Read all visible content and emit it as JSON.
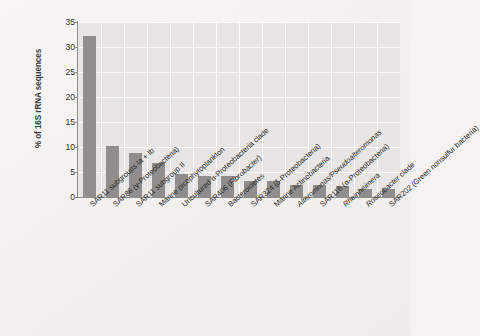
{
  "chart_data": {
    "type": "bar",
    "title": "",
    "xlabel": "",
    "ylabel": "% of 16S rRNA sequences",
    "ylim": [
      0,
      35
    ],
    "yticks": [
      0,
      5,
      10,
      15,
      20,
      25,
      30,
      35
    ],
    "grid": true,
    "legend": "none",
    "bar_color": "#8f8e8c",
    "plot_background": "#e7e6e4",
    "gridline_color": "#fbfbfa",
    "categories": [
      "SAR11 subgroups Ia + Ib",
      "SAR86 (γ-Proteobacteria)",
      "SAR11 subgroup II",
      "Marine picophytoplankton",
      "Uncultured α-Proteobacteria clade",
      "SAR406 (Fibrobacter)",
      "Bacteroidetes",
      "SAR324 (δ-Proteobacteria)",
      "Marine Actinobacteria",
      "Alteromonas/Pseudoalteromonas",
      "SAR116 (α-Proteobacteria)",
      "Rheinheimera",
      "Roseobacter clade",
      "SAR202 (Green nonsulfur bacteria)"
    ],
    "values": [
      32.3,
      10.2,
      8.8,
      6.8,
      4.6,
      4.3,
      4.2,
      3.3,
      3.3,
      2.4,
      2.4,
      2.2,
      1.7,
      1.6
    ]
  },
  "axis": {
    "y_title": "% of 16S rRNA sequences",
    "tick_0": "0",
    "tick_5": "5",
    "tick_10": "10",
    "tick_15": "15",
    "tick_20": "20",
    "tick_25": "25",
    "tick_30": "30",
    "tick_35": "35"
  },
  "labels": {
    "l0": "SAR11 subgroups Ia + Ib",
    "l1": "SAR86 (γ-Proteobacteria)",
    "l2": "SAR11 subgroup II",
    "l3": "Marine picophytoplankton",
    "l4": "Uncultured α-Proteobacteria clade",
    "l5": "SAR406 (Fibrobacter)",
    "l6": "Bacteroidetes",
    "l7": "SAR324 (δ-Proteobacteria)",
    "l8": "Marine Actinobacteria",
    "l9": "Alteromonas/Pseudoalteromonas",
    "l10": "SAR116 (α-Proteobacteria)",
    "l11": "Rheinheimera",
    "l12": "Roseobacter clade",
    "l13": "SAR202 (Green nonsulfur bacteria)"
  }
}
